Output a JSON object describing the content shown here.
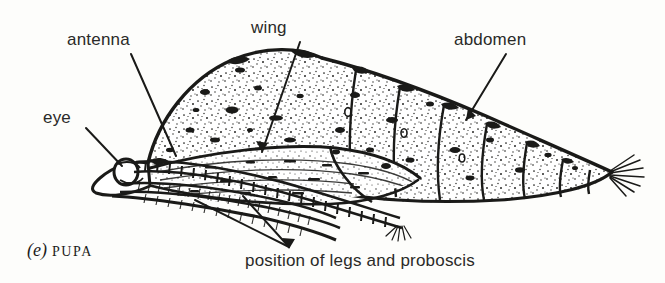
{
  "figure": {
    "caption_letter": "(e)",
    "caption_word": "PUPA",
    "background_color": "#fdfdfb",
    "ink_color": "#1a1a18"
  },
  "labels": {
    "antenna": "antenna",
    "eye": "eye",
    "wing": "wing",
    "abdomen": "abdomen",
    "legs_proboscis": "position of legs and proboscis"
  },
  "parts": [
    {
      "name": "antenna",
      "label": "antenna",
      "leader_from": [
        130,
        52
      ],
      "leader_to": [
        175,
        155
      ]
    },
    {
      "name": "eye",
      "label": "eye",
      "leader_from": [
        84,
        126
      ],
      "leader_to": [
        120,
        165
      ]
    },
    {
      "name": "wing",
      "label": "wing",
      "leader_from": [
        300,
        40
      ],
      "leader_to": [
        262,
        152
      ]
    },
    {
      "name": "abdomen",
      "label": "abdomen",
      "leader_from": [
        505,
        52
      ],
      "leader_to": [
        468,
        118
      ]
    },
    {
      "name": "legs-and-proboscis",
      "label": "position of legs and proboscis",
      "leader_from": [
        290,
        248
      ],
      "leader_to": [
        193,
        200
      ]
    }
  ],
  "anatomy": {
    "head_end": "left",
    "tail_end": "right",
    "abdominal_segments": 7,
    "cremaster": "bristle tuft at posterior tip",
    "texture": "stippled with dark blotches"
  }
}
